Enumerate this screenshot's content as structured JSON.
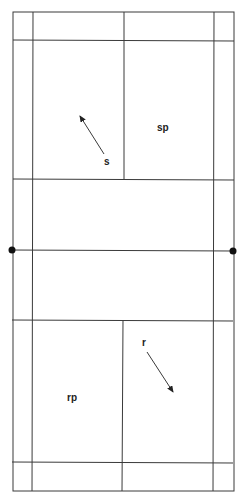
{
  "diagram": {
    "type": "badminton-court",
    "labels": {
      "server": "s",
      "server_partner": "sp",
      "receiver": "r",
      "receiver_partner": "rp"
    },
    "colors": {
      "line": "#3a3a3a",
      "text": "#222222",
      "background": "#ffffff"
    }
  }
}
